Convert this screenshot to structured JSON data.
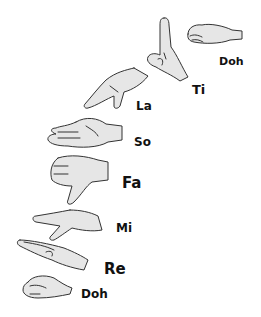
{
  "colors": {
    "hand_fill": "#e6e6e6",
    "outline": "#333333",
    "text": "#111111",
    "background": "#ffffff"
  },
  "signs": [
    {
      "syllable": "Doh",
      "position": "top",
      "gesture": "closed fist, horizontal"
    },
    {
      "syllable": "Ti",
      "gesture": "index finger pointing up"
    },
    {
      "syllable": "La",
      "gesture": "hand drooping down, relaxed"
    },
    {
      "syllable": "So",
      "gesture": "flat hand, palm facing in"
    },
    {
      "syllable": "Fa",
      "gesture": "thumb pointing down"
    },
    {
      "syllable": "Mi",
      "gesture": "flat hand, palm down, horizontal"
    },
    {
      "syllable": "Re",
      "gesture": "hand slanted upward"
    },
    {
      "syllable": "Doh",
      "position": "bottom",
      "gesture": "closed fist, horizontal"
    }
  ]
}
